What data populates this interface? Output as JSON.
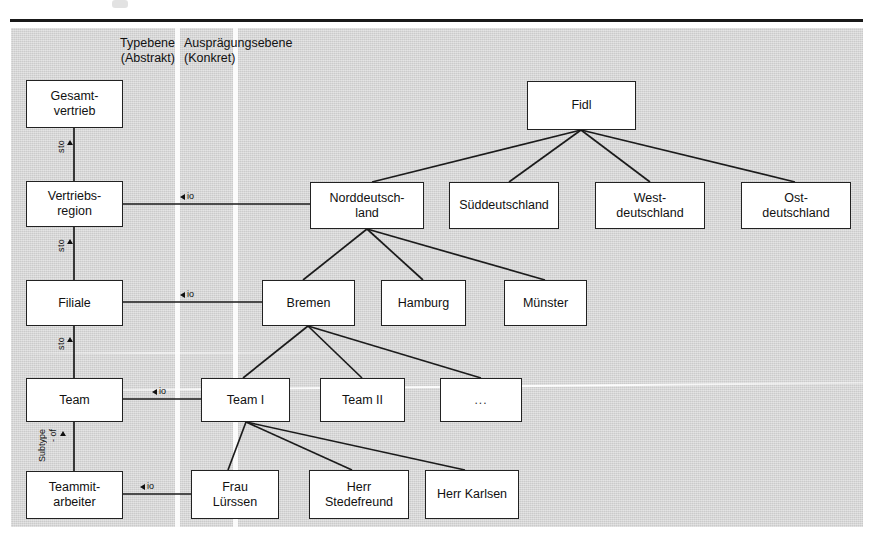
{
  "figure": {
    "panel_bg": "#d6d6d6",
    "box_bg": "#ffffff",
    "line_color": "#1b1b1b"
  },
  "columns": {
    "type_level": "Typebene\n(Abstrakt)",
    "instance_level": "Ausprägungsebene\n(Konkret)"
  },
  "type_level_nodes": [
    {
      "id": "gesamtvertrieb",
      "label": "Gesamt-\nvertrieb"
    },
    {
      "id": "vertriebsregion",
      "label": "Vertriebs-\nregion"
    },
    {
      "id": "filiale",
      "label": "Filiale"
    },
    {
      "id": "team",
      "label": "Team"
    },
    {
      "id": "teammitarbeiter",
      "label": "Teammit-\narbeiter"
    }
  ],
  "instance_level_nodes": [
    {
      "id": "fidl",
      "label": "Fidl"
    },
    {
      "id": "norddeutschland",
      "label": "Norddeutsch-\nland"
    },
    {
      "id": "sueddeutschland",
      "label": "Süddeutschland"
    },
    {
      "id": "westdeutschland",
      "label": "West-\ndeutschland"
    },
    {
      "id": "ostdeutschland",
      "label": "Ost-\ndeutschland"
    },
    {
      "id": "bremen",
      "label": "Bremen"
    },
    {
      "id": "hamburg",
      "label": "Hamburg"
    },
    {
      "id": "muenster",
      "label": "Münster"
    },
    {
      "id": "team1",
      "label": "Team I"
    },
    {
      "id": "team2",
      "label": "Team II"
    },
    {
      "id": "teamdots",
      "label": "..."
    },
    {
      "id": "frau_luerssen",
      "label": "Frau\nLürssen"
    },
    {
      "id": "herr_stedefreund",
      "label": "Herr\nStedefreund"
    },
    {
      "id": "herr_karlsen",
      "label": "Herr Karlsen"
    }
  ],
  "relations": {
    "sto_label": "sto",
    "subtype_label_line1": "Subtype",
    "subtype_label_line2": "- of",
    "io_label": "io"
  },
  "vertical_relations": [
    {
      "from": "gesamtvertrieb",
      "to": "vertriebsregion",
      "label": "sto"
    },
    {
      "from": "vertriebsregion",
      "to": "filiale",
      "label": "sto"
    },
    {
      "from": "filiale",
      "to": "team",
      "label": "sto"
    },
    {
      "from": "team",
      "to": "teammitarbeiter",
      "label": "Subtype - of"
    }
  ],
  "instance_of_relations": [
    {
      "type": "vertriebsregion",
      "instance": "norddeutschland",
      "label": "io"
    },
    {
      "type": "filiale",
      "instance": "bremen",
      "label": "io"
    },
    {
      "type": "team",
      "instance": "team1",
      "label": "io"
    },
    {
      "type": "teammitarbeiter",
      "instance": "frau_luerssen",
      "label": "io"
    }
  ],
  "hierarchy_edges": [
    {
      "parent": "fidl",
      "child": "norddeutschland"
    },
    {
      "parent": "fidl",
      "child": "sueddeutschland"
    },
    {
      "parent": "fidl",
      "child": "westdeutschland"
    },
    {
      "parent": "fidl",
      "child": "ostdeutschland"
    },
    {
      "parent": "norddeutschland",
      "child": "bremen"
    },
    {
      "parent": "norddeutschland",
      "child": "hamburg"
    },
    {
      "parent": "norddeutschland",
      "child": "muenster"
    },
    {
      "parent": "bremen",
      "child": "team1"
    },
    {
      "parent": "bremen",
      "child": "team2"
    },
    {
      "parent": "bremen",
      "child": "teamdots"
    },
    {
      "parent": "team1",
      "child": "frau_luerssen"
    },
    {
      "parent": "team1",
      "child": "herr_stedefreund"
    },
    {
      "parent": "team1",
      "child": "herr_karlsen"
    }
  ]
}
